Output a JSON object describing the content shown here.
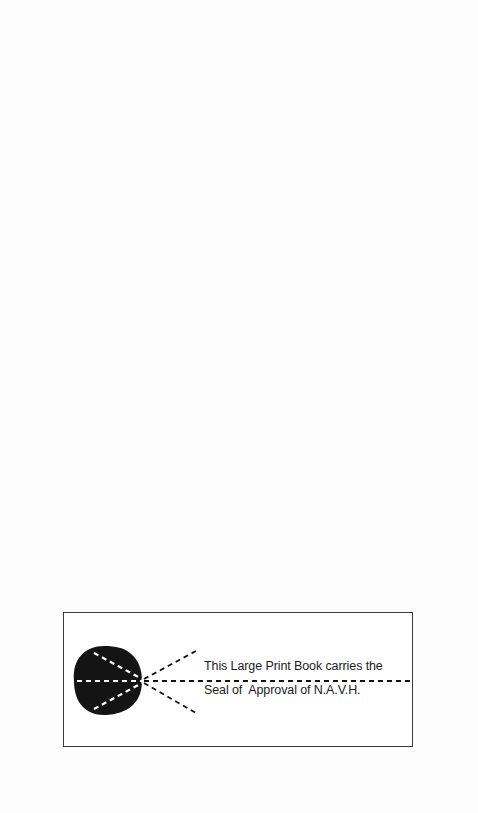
{
  "page": {
    "background": "#fdfdfd"
  },
  "seal": {
    "line1": "This Large Print Book carries the",
    "line2": "Seal of  Approval of N.A.V.H.",
    "icon": "eye-icon",
    "border_color": "#3a3a3a",
    "ink_color": "#111111"
  }
}
